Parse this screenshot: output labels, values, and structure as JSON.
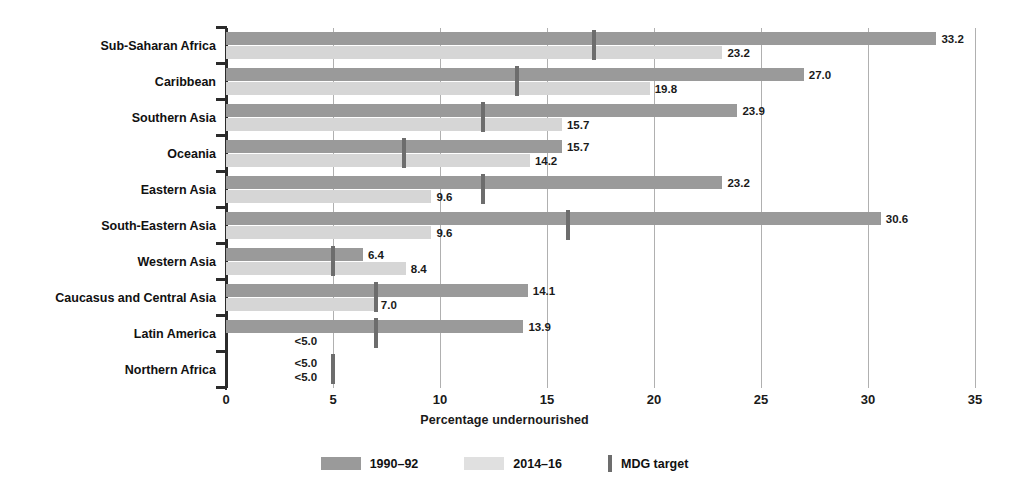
{
  "chart_data": {
    "type": "bar",
    "orientation": "horizontal",
    "title": "",
    "xlabel": "Percentage undernourished",
    "ylabel": "",
    "xlim": [
      0,
      35
    ],
    "xticks": [
      0,
      5,
      10,
      15,
      20,
      25,
      30,
      35
    ],
    "grid": true,
    "legend_position": "bottom-center",
    "categories": [
      "Sub-Saharan Africa",
      "Caribbean",
      "Southern Asia",
      "Oceania",
      "Eastern Asia",
      "South-Eastern Asia",
      "Western Asia",
      "Caucasus and Central Asia",
      "Latin America",
      "Northern Africa"
    ],
    "series": [
      {
        "name": "1990–92",
        "color": "#9a9a9a",
        "values": [
          33.2,
          27.0,
          23.9,
          15.7,
          23.2,
          30.6,
          6.4,
          14.1,
          13.9,
          null
        ],
        "labels": [
          "33.2",
          "27.0",
          "23.9",
          "15.7",
          "23.2",
          "30.6",
          "6.4",
          "14.1",
          "13.9",
          "<5.0"
        ]
      },
      {
        "name": "2014–16",
        "color": "#d6d6d6",
        "values": [
          23.2,
          19.8,
          15.7,
          14.2,
          9.6,
          9.6,
          8.4,
          7.0,
          null,
          null
        ],
        "labels": [
          "23.2",
          "19.8",
          "15.7",
          "14.2",
          "9.6",
          "9.6",
          "8.4",
          "7.0",
          "<5.0",
          "<5.0"
        ]
      }
    ],
    "markers": {
      "name": "MDG target",
      "color": "#6d6d6d",
      "values": [
        17.2,
        13.6,
        12.0,
        8.3,
        12.0,
        16.0,
        5.0,
        7.0,
        7.0,
        5.0
      ]
    }
  },
  "legend": {
    "items": [
      {
        "label": "1990–92",
        "swatch": "s1990"
      },
      {
        "label": "2014–16",
        "swatch": "s2014"
      },
      {
        "label": "MDG target",
        "swatch": "mdg"
      }
    ]
  },
  "axis": {
    "x_title": "Percentage undernourished",
    "x_tick_labels": [
      "0",
      "5",
      "10",
      "15",
      "20",
      "25",
      "30",
      "35"
    ]
  }
}
